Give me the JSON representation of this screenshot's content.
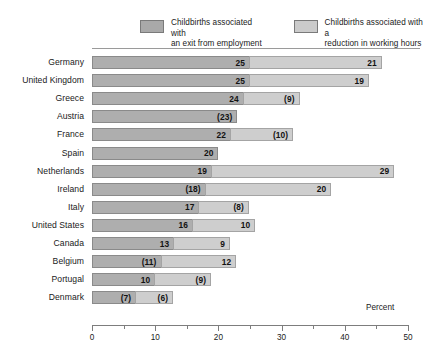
{
  "chart_data": {
    "type": "bar",
    "orientation": "horizontal",
    "stacked": true,
    "title": "",
    "xlabel": "Percent",
    "ylabel": "",
    "xlim": [
      0,
      50
    ],
    "xticks": [
      0,
      10,
      20,
      30,
      40,
      50
    ],
    "xtick_labels": [
      "0",
      "10",
      "20",
      "30",
      "40",
      "50"
    ],
    "minor_tick_step": 5,
    "grid": false,
    "legend_position": "top",
    "categories": [
      "Germany",
      "United Kingdom",
      "Greece",
      "Austria",
      "France",
      "Spain",
      "Netherlands",
      "Ireland",
      "Italy",
      "United States",
      "Canada",
      "Belgium",
      "Portugal",
      "Denmark"
    ],
    "series": [
      {
        "name": "Childbirths associated with an exit from employment",
        "color": "#aeaeae",
        "values": [
          25,
          25,
          24,
          23,
          22,
          20,
          19,
          18,
          17,
          16,
          13,
          11,
          10,
          7
        ],
        "labels": [
          "25",
          "25",
          "24",
          "(23)",
          "22",
          "20",
          "19",
          "(18)",
          "17",
          "16",
          "13",
          "(11)",
          "10",
          "(7)"
        ]
      },
      {
        "name": "Childbirths associated with a reduction in working hours",
        "color": "#cecece",
        "values": [
          21,
          19,
          9,
          0,
          10,
          0,
          29,
          20,
          8,
          10,
          9,
          12,
          9,
          6
        ],
        "labels": [
          "21",
          "19",
          "(9)",
          "",
          "(10)",
          "",
          "29",
          "20",
          "(8)",
          "10",
          "9",
          "12",
          "(9)",
          "(6)"
        ]
      }
    ]
  },
  "legend": {
    "items": [
      {
        "swatch": "dark",
        "label": "Childbirths associated with\nan exit from employment"
      },
      {
        "swatch": "light",
        "label": "Childbirths associated with a\nreduction in working hours"
      }
    ]
  },
  "axis": {
    "title": "Percent"
  },
  "colors": {
    "series_1": "#aeaeae",
    "series_2": "#cecece",
    "border": "#8a8a8a",
    "text": "#1a1a1a",
    "background": "#ffffff"
  }
}
